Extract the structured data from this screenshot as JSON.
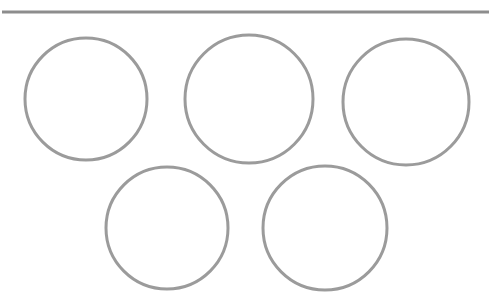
{
  "canvas": {
    "width": 492,
    "height": 293,
    "background_color": "#ffffff",
    "description": "Five gray outlined circles arranged in two rows beneath a horizontal rule"
  },
  "divider": {
    "label": "horizontal-rule",
    "color": "#8d8d8d",
    "x1": 2,
    "y1": 11,
    "x2": 489,
    "y2": 13,
    "thickness": 3
  },
  "shapes": {
    "stroke_color": "#9b9b9b",
    "fill_color": "none",
    "stroke_width": 3,
    "count": 5,
    "circles": [
      {
        "name": "circle-top-left",
        "label": "Circle 1",
        "cx": 86,
        "cy": 99,
        "r": 61
      },
      {
        "name": "circle-top-center",
        "label": "Circle 2",
        "cx": 249,
        "cy": 99,
        "r": 64
      },
      {
        "name": "circle-top-right",
        "label": "Circle 3",
        "cx": 406,
        "cy": 102,
        "r": 63
      },
      {
        "name": "circle-bottom-left",
        "label": "Circle 4",
        "cx": 167,
        "cy": 228,
        "r": 61
      },
      {
        "name": "circle-bottom-right",
        "label": "Circle 5",
        "cx": 325,
        "cy": 228,
        "r": 62
      }
    ]
  }
}
